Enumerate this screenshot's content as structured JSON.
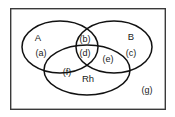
{
  "diagram": {
    "frame": {
      "x": 10,
      "y": 8,
      "width": 156,
      "height": 102,
      "stroke_color": "#3a3a3a",
      "fill_color": "#ffffff"
    },
    "stroke_color": "#111111",
    "text_color": "#1a1a1a",
    "background_color": "#ffffff",
    "sets": [
      {
        "key": "set-a",
        "label": "A",
        "label_x": 38,
        "label_y": 38,
        "cx": 60,
        "cy": 47,
        "rx": 38,
        "ry": 26
      },
      {
        "key": "set-b",
        "label": "B",
        "label_x": 131,
        "label_y": 37,
        "cx": 114,
        "cy": 47,
        "rx": 38,
        "ry": 26
      },
      {
        "key": "set-rh",
        "label": "Rh",
        "label_x": 88,
        "label_y": 79,
        "cx": 87,
        "cy": 70,
        "rx": 43,
        "ry": 25
      }
    ],
    "regions": [
      {
        "key": "region-a",
        "label": "(a)",
        "x": 41,
        "y": 54
      },
      {
        "key": "region-b",
        "label": "(b)",
        "x": 85,
        "y": 40
      },
      {
        "key": "region-c",
        "label": "(c)",
        "x": 131,
        "y": 54
      },
      {
        "key": "region-d",
        "label": "(d)",
        "x": 85,
        "y": 54
      },
      {
        "key": "region-e",
        "label": "(e)",
        "x": 108,
        "y": 60
      },
      {
        "key": "region-f",
        "label": "(f)",
        "x": 67,
        "y": 73
      },
      {
        "key": "region-g",
        "label": "(g)",
        "x": 147,
        "y": 91
      }
    ]
  }
}
